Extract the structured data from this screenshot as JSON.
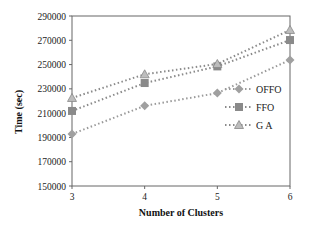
{
  "chart_data": {
    "type": "line",
    "title": "",
    "xlabel": "Number  of Clusters",
    "ylabel": "Time (sec)",
    "x": [
      3,
      4,
      5,
      6
    ],
    "xticks": [
      "3",
      "4",
      "5",
      "6"
    ],
    "yticks": [
      "150000",
      "170000",
      "190000",
      "210000",
      "230000",
      "250000",
      "270000",
      "290000"
    ],
    "ylim": [
      150000,
      290000
    ],
    "grid": false,
    "legend_position": "right-inside",
    "series": [
      {
        "name": "OFFO",
        "marker": "diamond",
        "color": "#9a9a9a",
        "values": [
          192800,
          216000,
          226500,
          253800
        ]
      },
      {
        "name": "FFO",
        "marker": "square",
        "color": "#8a8a8a",
        "values": [
          211800,
          234800,
          248500,
          270200
        ]
      },
      {
        "name": "GA",
        "marker": "triangle",
        "color": "#8a8a8a",
        "values": [
          222500,
          242000,
          250500,
          278500
        ]
      }
    ]
  }
}
